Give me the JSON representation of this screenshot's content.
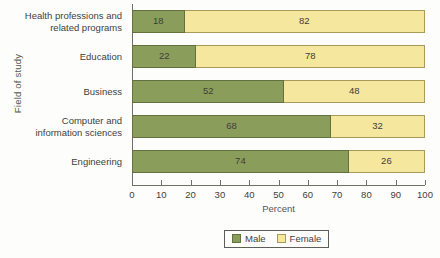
{
  "chart_data": {
    "type": "bar",
    "subtype": "horizontal-100-percent-stacked",
    "title": "",
    "xlabel": "Percent",
    "ylabel": "Field of study",
    "xlim": [
      0,
      100
    ],
    "xticks": [
      0,
      10,
      20,
      30,
      40,
      50,
      60,
      70,
      80,
      90,
      100
    ],
    "grid": false,
    "legend_position": "bottom",
    "categories": [
      "Health professions and related programs",
      "Education",
      "Business",
      "Computer and information sciences",
      "Engineering"
    ],
    "category_lines": [
      [
        "Health professions and",
        "related programs"
      ],
      [
        "Education"
      ],
      [
        "Business"
      ],
      [
        "Computer and",
        "information sciences"
      ],
      [
        "Engineering"
      ]
    ],
    "series": [
      {
        "name": "Male",
        "color": "#8a9d5b",
        "values": [
          18,
          22,
          52,
          68,
          74
        ]
      },
      {
        "name": "Female",
        "color": "#f5e79e",
        "values": [
          82,
          78,
          48,
          32,
          26
        ]
      }
    ]
  },
  "legend": {
    "items": [
      {
        "label": "Male",
        "swatch": "male-color-swatch"
      },
      {
        "label": "Female",
        "swatch": "female-color-swatch"
      }
    ]
  },
  "colors": {
    "male": "#8a9d5b",
    "female": "#f5e79e",
    "male_border": "#63713f",
    "female_border": "#a89a59",
    "axis": "#6f6f68",
    "text": "#3f3f3a",
    "background": "#fdfdfc"
  }
}
